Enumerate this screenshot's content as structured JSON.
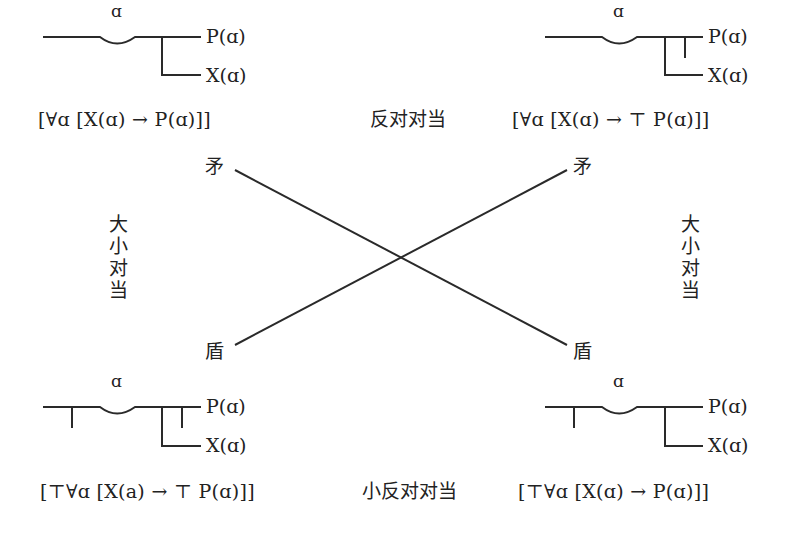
{
  "diagram": {
    "type": "square-of-opposition",
    "notation": "Frege concept-script (Begriffsschrift)",
    "corners": {
      "top_left": {
        "variable": "ɑ",
        "upper_label": "P(ɑ)",
        "lower_label": "X(ɑ)",
        "formula": "[∀ɑ [X(ɑ) → P(ɑ)]]",
        "negation_strokes": []
      },
      "top_right": {
        "variable": "ɑ",
        "upper_label": "P(ɑ)",
        "lower_label": "X(ɑ)",
        "formula": "[∀ɑ [X(ɑ) → ⊤ P(ɑ)]]",
        "negation_strokes": [
          "consequent"
        ]
      },
      "bottom_left": {
        "variable": "ɑ",
        "upper_label": "P(ɑ)",
        "lower_label": "X(ɑ)",
        "formula": "[⊤∀ɑ [X(a) → ⊤ P(ɑ)]]",
        "negation_strokes": [
          "whole",
          "consequent"
        ]
      },
      "bottom_right": {
        "variable": "ɑ",
        "upper_label": "P(ɑ)",
        "lower_label": "X(ɑ)",
        "formula": "[⊤∀ɑ [X(ɑ) → P(ɑ)]]",
        "negation_strokes": [
          "whole"
        ]
      }
    },
    "relations": {
      "top": "反对对当",
      "bottom": "小反对对当",
      "left": "大小对当",
      "right": "大小对当",
      "diagonal_start": "矛",
      "diagonal_end": "盾"
    },
    "diagonal_labels": {
      "top_left": "矛",
      "top_right": "矛",
      "bottom_left": "盾",
      "bottom_right": "盾"
    },
    "colors": {
      "stroke": "#2a2a2a",
      "text": "#222222",
      "background": "#ffffff"
    }
  }
}
